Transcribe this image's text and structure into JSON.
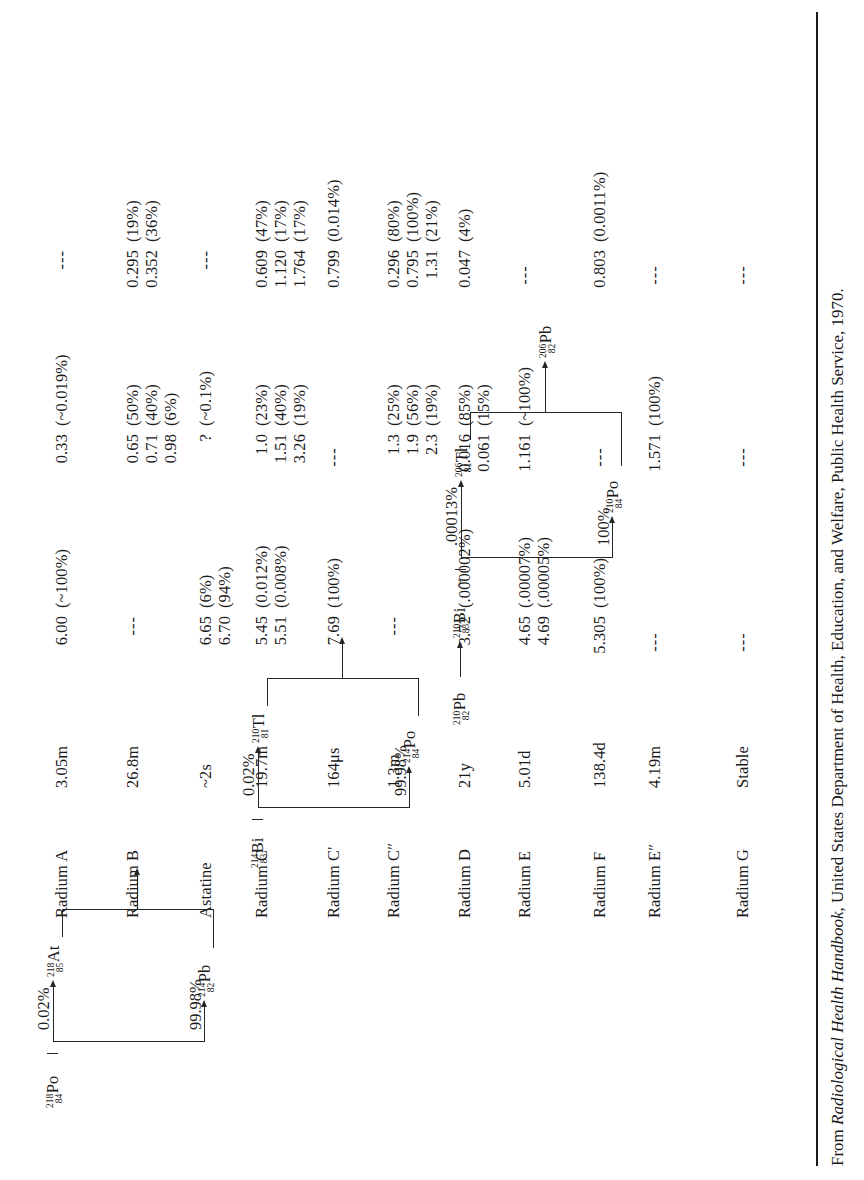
{
  "figure": {
    "caption_prefix": "From ",
    "caption_italic": "Radiological Health Handbook",
    "caption_suffix": ", United States Department of Health, Education, and Welfare, Public Health Service, 1970."
  },
  "rows": [
    {
      "name": "Radium A",
      "half_life": "3.05m",
      "alpha": [
        "6.00"
      ],
      "alpha_pct": [
        "(~100%)"
      ],
      "beta": [
        "0.33"
      ],
      "beta_pct": [
        "(~0.019%)"
      ],
      "gamma": [],
      "gamma_pct": [],
      "gamma_dash": "---"
    },
    {
      "name": "Radium B",
      "half_life": "26.8m",
      "alpha": [],
      "alpha_pct": [],
      "alpha_dash": "---",
      "beta": [
        "0.65",
        "0.71",
        "0.98"
      ],
      "beta_pct": [
        "(50%)",
        "(40%)",
        "(6%)"
      ],
      "gamma": [
        "0.295",
        "0.352"
      ],
      "gamma_pct": [
        "(19%)",
        "(36%)"
      ]
    },
    {
      "name": "Astatine",
      "half_life": "~2s",
      "alpha": [
        "6.65",
        "6.70"
      ],
      "alpha_pct": [
        "(6%)",
        "(94%)"
      ],
      "beta": [
        "?"
      ],
      "beta_pct": [
        "(~0.1%)"
      ],
      "gamma": [],
      "gamma_pct": [],
      "gamma_dash": "---"
    },
    {
      "name": "Radium C",
      "half_life": "19.7m",
      "alpha": [
        "5.45",
        "5.51"
      ],
      "alpha_pct": [
        "(0.012%)",
        "(0.008%)"
      ],
      "beta": [
        "1.0",
        "1.51",
        "3.26"
      ],
      "beta_pct": [
        "(23%)",
        "(40%)",
        "(19%)"
      ],
      "gamma": [
        "0.609",
        "1.120",
        "1.764"
      ],
      "gamma_pct": [
        "(47%)",
        "(17%)",
        "(17%)"
      ]
    },
    {
      "name": "Radium C'",
      "half_life": "164μs",
      "alpha": [
        "7.69"
      ],
      "alpha_pct": [
        "(100%)"
      ],
      "beta": [],
      "beta_pct": [],
      "beta_dash": "---",
      "gamma": [
        "0.799"
      ],
      "gamma_pct": [
        "(0.014%)"
      ]
    },
    {
      "name": "Radium C″",
      "half_life": "1.3m",
      "alpha": [],
      "alpha_pct": [],
      "alpha_dash": "---",
      "beta": [
        "1.3",
        "1.9",
        "2.3"
      ],
      "beta_pct": [
        "(25%)",
        "(56%)",
        "(19%)"
      ],
      "gamma": [
        "0.296",
        "0.795",
        "1.31"
      ],
      "gamma_pct": [
        "(80%)",
        "(100%)",
        "(21%)"
      ]
    },
    {
      "name": "Radium D",
      "half_life": "21y",
      "alpha": [
        "3.72"
      ],
      "alpha_pct": [
        "(.000002%)"
      ],
      "beta": [
        "0.016",
        "0.061"
      ],
      "beta_pct": [
        "(85%)",
        "(15%)"
      ],
      "gamma": [
        "0.047"
      ],
      "gamma_pct": [
        "(4%)"
      ]
    },
    {
      "name": "Radium E",
      "half_life": "5.01d",
      "alpha": [
        "4.65",
        "4.69"
      ],
      "alpha_pct": [
        "(.00007%)",
        "(.00005%)"
      ],
      "beta": [
        "1.161"
      ],
      "beta_pct": [
        "(~100%)"
      ],
      "gamma": [],
      "gamma_pct": [],
      "gamma_dash": "---"
    },
    {
      "name": "Radium F",
      "half_life": "138.4d",
      "alpha": [
        "5.305"
      ],
      "alpha_pct": [
        "(100%)"
      ],
      "beta": [],
      "beta_pct": [],
      "beta_dash": "---",
      "gamma": [
        "0.803"
      ],
      "gamma_pct": [
        "(0.0011%)"
      ]
    },
    {
      "name": "Radium E″",
      "half_life": "4.19m",
      "alpha": [],
      "alpha_pct": [],
      "alpha_dash": "---",
      "beta": [
        "1.571"
      ],
      "beta_pct": [
        "(100%)"
      ],
      "gamma": [],
      "gamma_pct": [],
      "gamma_dash": "---"
    },
    {
      "name": "Radium G",
      "half_life": "Stable",
      "alpha": [],
      "alpha_pct": [],
      "alpha_dash": "---",
      "beta": [],
      "beta_pct": [],
      "beta_dash": "---",
      "gamma": [],
      "gamma_pct": [],
      "gamma_dash": "---"
    }
  ],
  "diagram": {
    "nuclides": {
      "po218": {
        "mass": "218",
        "atomic": "84",
        "symbol": "Po"
      },
      "at218": {
        "mass": "218",
        "atomic": "85",
        "symbol": "At"
      },
      "pb214": {
        "mass": "214",
        "atomic": "82",
        "symbol": "Pb"
      },
      "bi214": {
        "mass": "214",
        "atomic": "83",
        "symbol": "Bi"
      },
      "tl210": {
        "mass": "210",
        "atomic": "81",
        "symbol": "Tl"
      },
      "po214": {
        "mass": "214",
        "atomic": "84",
        "symbol": "Po"
      },
      "pb210": {
        "mass": "210",
        "atomic": "82",
        "symbol": "Pb"
      },
      "bi210": {
        "mass": "210",
        "atomic": "83",
        "symbol": "Bi"
      },
      "tl206": {
        "mass": "206",
        "atomic": "81",
        "symbol": "Tl"
      },
      "po210": {
        "mass": "210",
        "atomic": "84",
        "symbol": "Po"
      },
      "pb206": {
        "mass": "206",
        "atomic": "82",
        "symbol": "Pb"
      }
    },
    "branch_labels": {
      "b1_upper": "0.02%",
      "b1_lower": "99.98%",
      "b2_upper": "0.02%",
      "b2_lower": "99.98%",
      "b3_upper": ".00013%",
      "b3_upper_tilde": "~",
      "b3_lower": "100%"
    }
  }
}
